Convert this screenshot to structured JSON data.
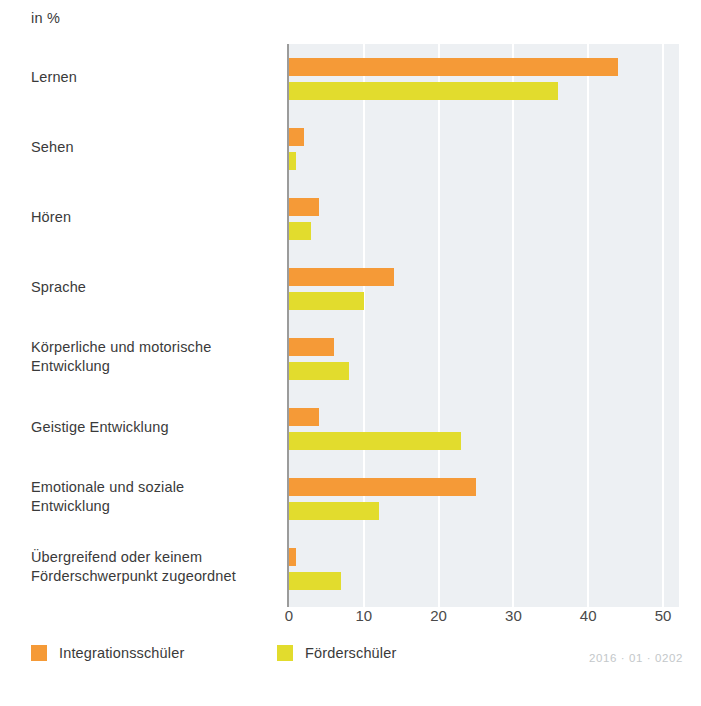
{
  "subtitle": "in %",
  "legend": {
    "series": [
      {
        "name": "Integrationsschüler",
        "color": "#f59a37"
      },
      {
        "name": "Förderschüler",
        "color": "#e2dc2d"
      }
    ]
  },
  "footer_code": "2016 · 01 · 0202",
  "chart_data": {
    "type": "bar",
    "orientation": "horizontal",
    "title": "",
    "subtitle": "in %",
    "xlabel": "",
    "ylabel": "",
    "xlim": [
      0,
      50
    ],
    "xticks": [
      0,
      10,
      20,
      30,
      40,
      50
    ],
    "tick_labels": [
      "0",
      "10",
      "20",
      "30",
      "40",
      "50"
    ],
    "grid": "vertical-white-gridlines",
    "legend_position": "bottom-left",
    "plot_background": "#edf0f3",
    "categories": [
      "Lernen",
      "Sehen",
      "Hören",
      "Sprache",
      "Körperliche und motorische\nEntwicklung",
      "Geistige Entwicklung",
      "Emotionale und soziale\nEntwicklung",
      "Übergreifend oder keinem\nFörderschwerpunkt zugeordnet"
    ],
    "series": [
      {
        "name": "Integrationsschüler",
        "color": "#f59a37",
        "values": [
          44,
          2,
          4,
          14,
          6,
          4,
          25,
          1
        ]
      },
      {
        "name": "Förderschüler",
        "color": "#e2dc2d",
        "values": [
          36,
          1,
          3,
          10,
          8,
          23,
          12,
          7
        ]
      }
    ]
  }
}
